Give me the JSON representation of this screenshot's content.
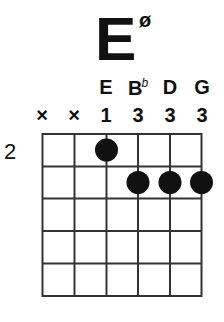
{
  "chord": {
    "root": "E",
    "quality_symbol": "ø"
  },
  "strings": [
    {
      "note": "",
      "note_accidental": "",
      "marker": "×"
    },
    {
      "note": "",
      "note_accidental": "",
      "marker": "×"
    },
    {
      "note": "E",
      "note_accidental": "",
      "marker": "1"
    },
    {
      "note": "B",
      "note_accidental": "b",
      "marker": "3"
    },
    {
      "note": "D",
      "note_accidental": "",
      "marker": "3"
    },
    {
      "note": "G",
      "note_accidental": "",
      "marker": "3"
    }
  ],
  "fretboard": {
    "start_fret_label": "2",
    "num_strings": 6,
    "num_frets": 5,
    "dots": [
      {
        "string": 2,
        "fret": 1
      },
      {
        "string": 3,
        "fret": 2
      },
      {
        "string": 4,
        "fret": 2
      },
      {
        "string": 5,
        "fret": 2
      }
    ]
  },
  "colors": {
    "line": "#333333",
    "dot": "#111111",
    "background": "#ffffff"
  }
}
